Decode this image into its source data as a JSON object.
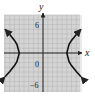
{
  "chart_data": {
    "type": "line",
    "title": "",
    "xlabel": "x",
    "ylabel": "y",
    "xlim": [
      -8,
      8
    ],
    "ylim": [
      -8,
      8
    ],
    "grid": true,
    "tick_labels": {
      "y_top": "6",
      "origin": "0",
      "y_bottom": "-6"
    },
    "equation": "x^2/25 - y^2/16 = 1",
    "series": [
      {
        "name": "right branch",
        "points": [
          [
            8.0,
            -5.0
          ],
          [
            7.0,
            -3.92
          ],
          [
            6.0,
            -2.65
          ],
          [
            5.5,
            -1.83
          ],
          [
            5.0,
            0
          ],
          [
            5.5,
            1.83
          ],
          [
            6.0,
            2.65
          ],
          [
            7.0,
            3.92
          ],
          [
            8.0,
            5.0
          ]
        ]
      },
      {
        "name": "left branch",
        "points": [
          [
            -8.0,
            -5.0
          ],
          [
            -7.0,
            -3.92
          ],
          [
            -6.0,
            -2.65
          ],
          [
            -5.5,
            -1.83
          ],
          [
            -5.0,
            0
          ],
          [
            -5.5,
            1.83
          ],
          [
            -6.0,
            2.65
          ],
          [
            -7.0,
            3.92
          ],
          [
            -8.0,
            5.0
          ]
        ]
      }
    ]
  },
  "colors": {
    "grid_bg": "#d4d4d4",
    "grid_line": "#b8b8b8",
    "axis": "#222222",
    "curve": "#111111"
  }
}
